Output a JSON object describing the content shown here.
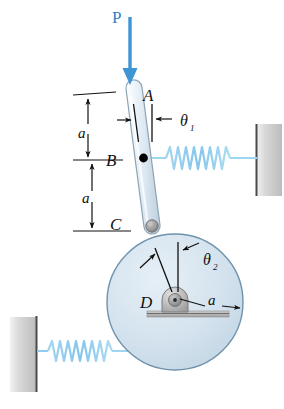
{
  "figure": {
    "name": "slender-rod-disk-spring-mechanism",
    "background_color": "#ffffff"
  },
  "labels": {
    "force_P": "P",
    "point_A": "A",
    "point_B": "B",
    "point_C": "C",
    "point_D": "D",
    "theta_1": "θ",
    "theta_1_sub": "1",
    "theta_2": "θ",
    "theta_2_sub": "2",
    "dim_a_upper": "a",
    "dim_a_lower": "a",
    "dim_a_radius": "a"
  },
  "colors": {
    "force_arrow": "#3f94d3",
    "force_label": "#2f7fc2",
    "spring": "#7fc4ea",
    "spring_light": "#bfe2f5",
    "disk_fill": "#d3e2ee",
    "disk_stroke": "#6f93ad",
    "rod_fill": "#e8f1f8",
    "rod_stroke": "#8fa3b2",
    "wall_fill": "#c9c9c9",
    "wall_edge": "#555555",
    "hub_fill": "#b9b9b9",
    "base_fill": "#b0b0b0",
    "pin_fill": "#9a9a9a",
    "line": "#111111",
    "point_dot": "#000000"
  },
  "geometry": {
    "point_A": {
      "x": 134,
      "y": 88
    },
    "point_B": {
      "x": 144,
      "y": 158
    },
    "point_C": {
      "x": 152,
      "y": 226
    },
    "point_D": {
      "x": 175,
      "y": 302
    },
    "disk_radius": 68,
    "rod_half_width": 7,
    "theta_1_value_desc": "angle of rod AC from vertical",
    "theta_2_value_desc": "angle of line DC from vertical"
  },
  "elements": {
    "force_arrow_name": "applied-force-arrow-P",
    "rod_name": "slender-rod-AC",
    "disk_name": "circular-disk-D",
    "spring_upper_name": "spring-upper-right",
    "spring_lower_name": "spring-lower-left",
    "wall_upper_name": "wall-right",
    "wall_lower_name": "wall-left",
    "pivot_C_name": "pin-joint-C",
    "hub_D_name": "bearing-support-D",
    "dot_B_name": "point-B-marker"
  }
}
